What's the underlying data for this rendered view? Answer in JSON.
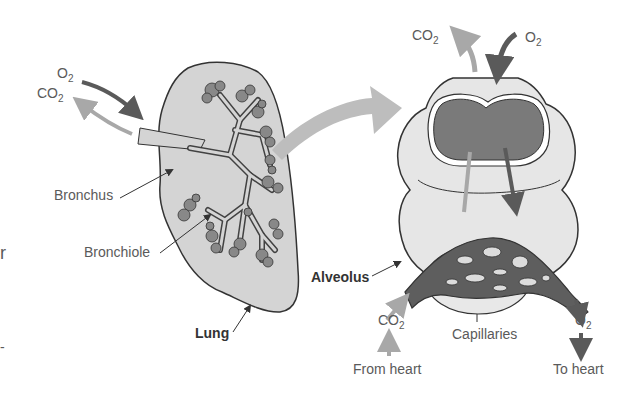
{
  "diagram": {
    "lung_panel": {
      "inflow_gas": "O",
      "inflow_sub": "2",
      "outflow_gas": "CO",
      "outflow_sub": "2",
      "labels": {
        "bronchus": "Bronchus",
        "bronchiole": "Bronchiole",
        "lung": "Lung"
      }
    },
    "alveolus_panel": {
      "top_out_gas": "CO",
      "top_out_sub": "2",
      "top_in_gas": "O",
      "top_in_sub": "2",
      "labels": {
        "alveolus": "Alveolus",
        "capillaries": "Capillaries"
      },
      "bottom_left_gas": "CO",
      "bottom_left_sub": "2",
      "bottom_left_caption": "From heart",
      "bottom_right_gas": "O",
      "bottom_right_sub": "2",
      "bottom_right_caption": "To heart"
    },
    "edge_fragments": {
      "left_char": "r",
      "left_dash": "-"
    },
    "colors": {
      "lung_fill": "#d4d4d4",
      "alveolus_fill": "#e6e6e6",
      "alveolus_cavity": "#7a7a7a",
      "capillary_fill": "#5e5e5e",
      "o2_arrow": "#5a5a5a",
      "co2_arrow": "#a8a8a8",
      "outline": "#333333"
    }
  }
}
